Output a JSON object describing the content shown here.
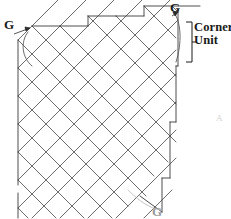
{
  "figure": {
    "kind": "quilt-lattice-diagram",
    "type": "diagram",
    "stroke_color": "#5a5a5a",
    "stroke_color_dark": "#3a3a3a",
    "background": "#ffffff",
    "width": 231,
    "height": 219
  },
  "labels": {
    "g_top_left": "G",
    "g_top_right": "G",
    "g_bottom": "G",
    "corner_unit_line1": "Corner",
    "corner_unit_line2": "Unit",
    "faint_right": "A"
  },
  "annotations": {
    "leader_top_left": "arrow-pointing-to-arc",
    "leader_top_right": "arrow-pointing-to-arc",
    "bracket": "corner-unit-bracket",
    "bracket_span_top": 22,
    "bracket_span_bottom": 62
  },
  "lattice": {
    "description": "on-point square grid rotated 45 degrees with half-square triangle edges",
    "cell_size": 28,
    "rotation_deg": 45,
    "rows": 7,
    "cols": 7,
    "edge_triangles_top": 4,
    "edge_triangles_right": 4,
    "edge_triangles_left": 3
  }
}
